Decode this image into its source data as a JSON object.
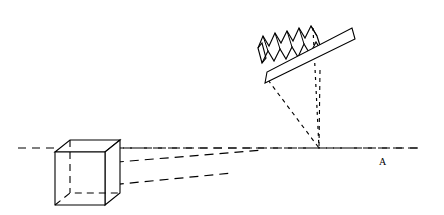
{
  "figure": {
    "title": "",
    "background_color": "#ffffff",
    "line_color": "#000000",
    "width": 444,
    "height": 215
  },
  "labels": {
    "axis_point_a": "A"
  },
  "axis": {
    "name": "horizontal-optical-axis",
    "style": "dashed",
    "x_start": 18,
    "x_end": 420,
    "y": 148,
    "dash": "8 6"
  },
  "objects": {
    "box": {
      "name": "rectangular-box",
      "description": "3D rectangular prism drawn in oblique projection at left of axis",
      "front_face": "55,152 105,152 105,205 55,205",
      "top_face": "55,152 70,140 120,140 105,152",
      "right_face": "105,152 120,140 120,193 105,205",
      "hidden_edges": [
        "55,205 70,193 120,193",
        "70,140 70,193"
      ]
    },
    "pleated_sheet": {
      "name": "zigzag-pleated-sheet",
      "description": "Accordion / sawtooth folded sheet above the mirror",
      "front_zigzag": "258,48 263,36 269,46 275,33 281,43 287,31 293,41 299,28 305,38 311,26 317,36",
      "back_zigzag": "262,63 268,51 274,61 280,49 286,59 292,47 298,57 304,44 310,54 316,42 322,52",
      "left_cap": "258,48 262,63",
      "right_cap": "317,36 322,52",
      "teeth_count": 5
    },
    "mirror": {
      "name": "mirror-plank",
      "description": "Thin elongated parallelogram (flat mirror / reflecting plank) tilted up to the right",
      "outline": "265,83 268,73 352,29 355,38",
      "angle_deg": -28
    }
  },
  "rays": {
    "convergence_point": {
      "x": 319,
      "y": 148
    },
    "box_rays": [
      {
        "name": "ray-upper",
        "from": "108,148",
        "to": "420,148"
      },
      {
        "name": "ray-middle",
        "from": "70,166",
        "to": "262,150"
      },
      {
        "name": "ray-lower",
        "from": "70,189",
        "to": "232,173"
      }
    ],
    "cone_edges": [
      {
        "name": "cone-edge-left",
        "from": "268,80",
        "to": "319,148"
      },
      {
        "name": "cone-edge-right",
        "from": "320,70",
        "to": "319,148"
      }
    ],
    "normal_line": {
      "name": "vertical-normal-line",
      "from": "313,28",
      "to": "319,148",
      "style": "dotted"
    }
  }
}
